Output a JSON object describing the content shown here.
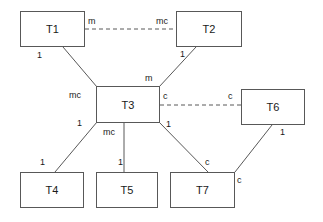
{
  "diagram": {
    "type": "entity-relationship-cardinality-diagram",
    "background_color": "#ffffff",
    "line_color": "#585858",
    "text_color": "#1a1a1a",
    "nodes": [
      {
        "id": "T1",
        "label": "T1",
        "x": 20,
        "y": 11,
        "w": 65,
        "h": 36
      },
      {
        "id": "T2",
        "label": "T2",
        "x": 176,
        "y": 11,
        "w": 66,
        "h": 36
      },
      {
        "id": "T3",
        "label": "T3",
        "x": 96,
        "y": 86,
        "w": 64,
        "h": 37
      },
      {
        "id": "T6",
        "label": "T6",
        "x": 241,
        "y": 89,
        "w": 64,
        "h": 36
      },
      {
        "id": "T4",
        "label": "T4",
        "x": 20,
        "y": 172,
        "w": 64,
        "h": 36
      },
      {
        "id": "T5",
        "label": "T5",
        "x": 96,
        "y": 172,
        "w": 62,
        "h": 36
      },
      {
        "id": "T7",
        "label": "T7",
        "x": 170,
        "y": 172,
        "w": 65,
        "h": 36
      }
    ],
    "edges": [
      {
        "from": "T1",
        "to": "T2",
        "style": "dashed",
        "x1": 85,
        "y1": 29,
        "x2": 176,
        "y2": 29
      },
      {
        "from": "T1",
        "to": "T3",
        "style": "solid",
        "x1": 63,
        "y1": 47,
        "x2": 97,
        "y2": 87
      },
      {
        "from": "T2",
        "to": "T3",
        "style": "solid",
        "x1": 196,
        "y1": 47,
        "x2": 159,
        "y2": 87
      },
      {
        "from": "T3",
        "to": "T6",
        "style": "dashed",
        "x1": 160,
        "y1": 105,
        "x2": 241,
        "y2": 105
      },
      {
        "from": "T3",
        "to": "T4",
        "style": "solid",
        "x1": 97,
        "y1": 122,
        "x2": 55,
        "y2": 172
      },
      {
        "from": "T3",
        "to": "T5",
        "style": "solid",
        "x1": 124,
        "y1": 123,
        "x2": 124,
        "y2": 172
      },
      {
        "from": "T3",
        "to": "T7",
        "style": "solid",
        "x1": 159,
        "y1": 122,
        "x2": 208,
        "y2": 172
      },
      {
        "from": "T6",
        "to": "T7",
        "style": "solid",
        "x1": 272,
        "y1": 125,
        "x2": 235,
        "y2": 172
      }
    ],
    "edge_labels": [
      {
        "text": "m",
        "x": 88,
        "y": 17,
        "for": "T1-T2-near-T1"
      },
      {
        "text": "mc",
        "x": 156,
        "y": 17,
        "for": "T1-T2-near-T2"
      },
      {
        "text": "1",
        "x": 37,
        "y": 51,
        "for": "T1-T3-near-T1"
      },
      {
        "text": "mc",
        "x": 69,
        "y": 91,
        "for": "T1-T3-near-T3"
      },
      {
        "text": "1",
        "x": 180,
        "y": 50,
        "for": "T2-T3-near-T2"
      },
      {
        "text": "m",
        "x": 145,
        "y": 74,
        "for": "T2-T3-near-T3"
      },
      {
        "text": "c",
        "x": 163,
        "y": 92,
        "for": "T3-T6-near-T3"
      },
      {
        "text": "c",
        "x": 228,
        "y": 92,
        "for": "T3-T6-near-T6"
      },
      {
        "text": "1",
        "x": 77,
        "y": 119,
        "for": "T3-T4-near-T3"
      },
      {
        "text": "1",
        "x": 40,
        "y": 158,
        "for": "T3-T4-near-T4"
      },
      {
        "text": "mc",
        "x": 103,
        "y": 128,
        "for": "T3-T5-near-T3"
      },
      {
        "text": "1",
        "x": 118,
        "y": 158,
        "for": "T3-T5-near-T5"
      },
      {
        "text": "1",
        "x": 166,
        "y": 120,
        "for": "T3-T7-near-T3"
      },
      {
        "text": "c",
        "x": 205,
        "y": 158,
        "for": "T3-T7-near-T7"
      },
      {
        "text": "1",
        "x": 280,
        "y": 128,
        "for": "T6-T7-near-T6"
      },
      {
        "text": "c",
        "x": 237,
        "y": 176,
        "for": "T6-T7-near-T7"
      }
    ]
  }
}
